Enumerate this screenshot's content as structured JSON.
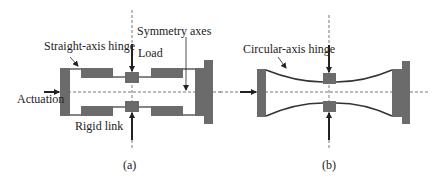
{
  "figure": {
    "panel_a": {
      "caption": "(a)",
      "labels": {
        "straight_axis_hinge": "Straight-axis hinge",
        "load": "Load",
        "symmetry_axes": "Symmetry axes",
        "actuation": "Actuation",
        "rigid_link": "Rigid link"
      }
    },
    "panel_b": {
      "caption": "(b)",
      "labels": {
        "circular_axis_hinge": "Circular-axis hinge"
      }
    },
    "colors": {
      "block_fill": "#6b6b6b",
      "line": "#333333",
      "dashed": "#555555"
    }
  }
}
